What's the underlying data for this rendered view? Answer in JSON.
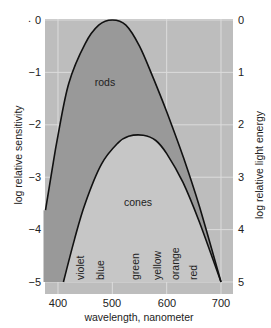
{
  "chart_data": {
    "type": "line",
    "title": "",
    "xlabel": "wavelength, nanometer",
    "ylabel": "log relative sensitivity",
    "ylabel_right": "log relative light energy",
    "xlim": [
      377,
      722
    ],
    "ylim": [
      -5.2,
      0
    ],
    "x_ticks": [
      "400",
      "500",
      "600",
      "700"
    ],
    "y_ticks_left": [
      "0",
      "−1",
      "−2",
      "−3",
      "−4",
      "−5"
    ],
    "y_ticks_right": [
      "0",
      "1",
      "2",
      "3",
      "4",
      "5"
    ],
    "grid": true,
    "series": [
      {
        "name": "rods",
        "x": [
          377,
          390,
          400,
          420,
          450,
          475,
          500,
          525,
          550,
          575,
          600,
          630,
          660,
          700
        ],
        "values": [
          -3.63,
          -2.8,
          -2.2,
          -1.2,
          -0.45,
          -0.1,
          0,
          -0.1,
          -0.5,
          -1.1,
          -1.75,
          -2.6,
          -3.55,
          -5
        ]
      },
      {
        "name": "cones",
        "x": [
          410,
          430,
          450,
          480,
          510,
          530,
          557,
          580,
          600,
          630,
          660,
          700
        ],
        "values": [
          -5,
          -4.2,
          -3.5,
          -2.75,
          -2.35,
          -2.22,
          -2.2,
          -2.3,
          -2.55,
          -3.1,
          -3.85,
          -5
        ]
      }
    ],
    "annotations": [
      "rods",
      "cones",
      "violet",
      "blue",
      "green",
      "yellow",
      "orange",
      "red"
    ]
  },
  "labels": {
    "rods": "rods",
    "cones": "cones",
    "colors": [
      "violet",
      "blue",
      "green",
      "yellow",
      "orange",
      "red"
    ],
    "xlabel": "wavelength, nanometer",
    "ylabel": "log relative sensitivity",
    "ylabel_right": "log relative light energy",
    "stray_mark": "."
  },
  "palette": {
    "plot_bg": "#bdbdbd",
    "rods_fill": "#999999",
    "cones_fill": "#c6c6c6",
    "grid": "#dcdcdc",
    "curve": "#111111"
  }
}
